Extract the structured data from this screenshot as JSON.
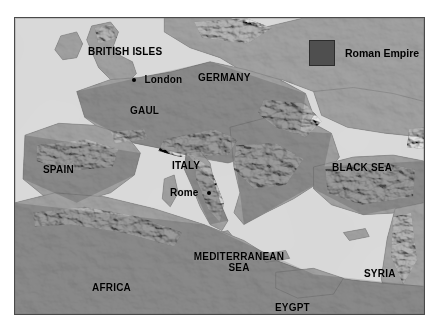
{
  "figure": {
    "kind": "shaded-relief-map",
    "title_visible": false,
    "background_color": "#ffffff",
    "border_color": "#4a4a4a",
    "sea_color": "#b4b4b4",
    "land_base_color": "#8f8f8f"
  },
  "legend": {
    "swatch_color": "#4f4f4f",
    "label": "Roman Empire"
  },
  "labels": {
    "regions": [
      {
        "name": "british-isles",
        "text": "BRITISH ISLES",
        "x": 73,
        "y": 29
      },
      {
        "name": "germany",
        "text": "GERMANY",
        "x": 183,
        "y": 55
      },
      {
        "name": "gaul",
        "text": "GAUL",
        "x": 115,
        "y": 88
      },
      {
        "name": "spain",
        "text": "SPAIN",
        "x": 28,
        "y": 147
      },
      {
        "name": "italy",
        "text": "ITALY",
        "x": 157,
        "y": 143
      },
      {
        "name": "black-sea",
        "text": "BLACK SEA",
        "x": 317,
        "y": 145
      },
      {
        "name": "syria",
        "text": "SYRIA",
        "x": 349,
        "y": 251
      },
      {
        "name": "africa",
        "text": "AFRICA",
        "x": 77,
        "y": 265
      },
      {
        "name": "eygpt",
        "text": "EYGPT",
        "x": 260,
        "y": 285
      }
    ],
    "seas": [
      {
        "name": "mediterranean-sea",
        "line1": "MEDITERRANEAN",
        "line2": "SEA",
        "x": 174,
        "y": 234
      }
    ],
    "cities": [
      {
        "name": "london",
        "text": "London",
        "x": 117,
        "y": 52,
        "dot_side": "left"
      },
      {
        "name": "rome",
        "text": "Rome",
        "x": 155,
        "y": 165,
        "dot_side": "right"
      }
    ]
  }
}
